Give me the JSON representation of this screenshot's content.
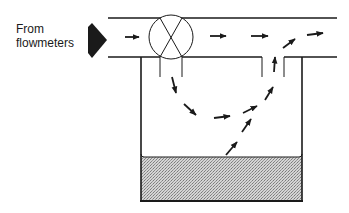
{
  "diagram": {
    "type": "flow-schematic",
    "inlet_label_line1": "From",
    "inlet_label_line2": "flowmeters",
    "components": [
      {
        "id": "inlet-arrow",
        "kind": "large-arrow",
        "direction": "right"
      },
      {
        "id": "pipe",
        "kind": "horizontal-pipe"
      },
      {
        "id": "valve",
        "kind": "circle-x-valve"
      },
      {
        "id": "tank",
        "kind": "open-tank-with-liquid"
      },
      {
        "id": "vent-gap",
        "kind": "return-opening"
      }
    ],
    "flow_arrows": [
      {
        "segment": "inlet-pipe",
        "direction": "right"
      },
      {
        "segment": "outlet-pipe",
        "direction": "right"
      },
      {
        "segment": "outlet-pipe",
        "direction": "right"
      },
      {
        "segment": "outlet-pipe-end",
        "direction": "right"
      },
      {
        "segment": "tank-down",
        "direction": "down"
      },
      {
        "segment": "tank-curve",
        "direction": "down-right"
      },
      {
        "segment": "tank-curve",
        "direction": "right"
      },
      {
        "segment": "tank-curve",
        "direction": "up-right"
      },
      {
        "segment": "tank-rise",
        "direction": "up-right"
      },
      {
        "segment": "from-liquid",
        "direction": "up-right"
      },
      {
        "segment": "from-liquid",
        "direction": "up-right"
      },
      {
        "segment": "vent-gap",
        "direction": "up"
      },
      {
        "segment": "into-pipe",
        "direction": "up-right"
      }
    ],
    "colors": {
      "line": "#1a1a1a",
      "liquid": "#bdbdbd",
      "background": "#ffffff"
    }
  }
}
